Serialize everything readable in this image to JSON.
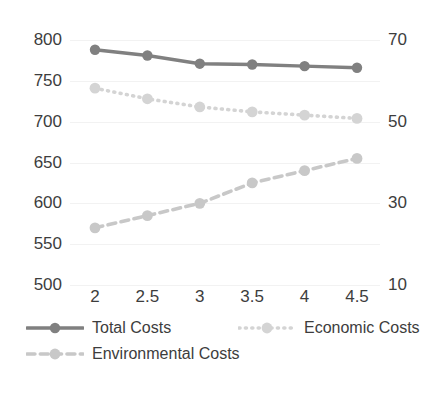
{
  "chart_data": {
    "type": "line",
    "title": "",
    "xlabel": "",
    "ylabel": "",
    "x": [
      2,
      2.5,
      3,
      3.5,
      4,
      4.5
    ],
    "xtick_labels": [
      "2",
      "2.5",
      "3",
      "3.5",
      "4",
      "4.5"
    ],
    "grid": true,
    "legend_position": "bottom",
    "axes": {
      "left": {
        "ticks": [
          800,
          750,
          700,
          650,
          600,
          550,
          500
        ],
        "tick_labels": [
          "800",
          "750",
          "700",
          "650",
          "600",
          "550",
          "500"
        ],
        "ylim": [
          500,
          800
        ]
      },
      "right": {
        "ticks": [
          70,
          50,
          30,
          10
        ],
        "tick_labels": [
          "70",
          "50",
          "30",
          "10"
        ],
        "ylim": [
          10,
          70
        ]
      }
    },
    "series": [
      {
        "name": "Total Costs",
        "axis": "left",
        "style": "solid",
        "color": "#808080",
        "marker": "circle",
        "values": [
          788,
          781,
          771,
          770,
          768,
          766
        ]
      },
      {
        "name": "Economic Costs",
        "axis": "left",
        "style": "dotted",
        "color": "#d4d4d4",
        "marker": "circle",
        "values": [
          741,
          728,
          718,
          712,
          708,
          704
        ]
      },
      {
        "name": "Environmental Costs",
        "axis": "right",
        "style": "dashed",
        "color": "#c8c8c8",
        "marker": "circle",
        "values": [
          24,
          27,
          30,
          35,
          38,
          41
        ]
      }
    ]
  },
  "legend": {
    "entries": [
      {
        "label": "Total Costs"
      },
      {
        "label": "Economic Costs"
      },
      {
        "label": "Environmental Costs"
      }
    ]
  }
}
